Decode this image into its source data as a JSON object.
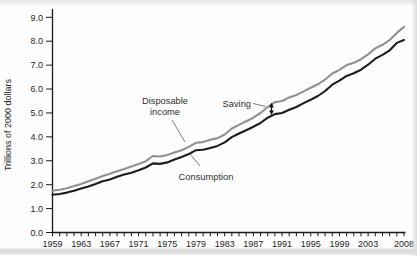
{
  "figure": {
    "labels": {
      "disposable_line1": "Disposable",
      "disposable_line2": "income",
      "saving": "Saving",
      "consumption": "Consumption"
    },
    "colors": {
      "disposable_income_line": "#8d9196",
      "consumption_line": "#1c1c1c",
      "axis": "#1a1a1a",
      "text": "#2e2e2e"
    }
  },
  "chart_data": {
    "type": "line",
    "title": "",
    "xlabel": "",
    "ylabel": "Trillions of 2000 dollars",
    "ylim": [
      0,
      9
    ],
    "ytick_labels": [
      "0.0",
      "1.0",
      "2.0",
      "3.0",
      "4.0",
      "5.0",
      "6.0",
      "7.0",
      "8.0",
      "9.0"
    ],
    "xtick_labels": [
      "1959",
      "1963",
      "1967",
      "1971",
      "1975",
      "1979",
      "1983",
      "1987",
      "1991",
      "1995",
      "1999",
      "2003",
      "2008"
    ],
    "grid": false,
    "legend": "inline annotations with pointer lines",
    "years": [
      1959,
      1960,
      1961,
      1962,
      1963,
      1964,
      1965,
      1966,
      1967,
      1968,
      1969,
      1970,
      1971,
      1972,
      1973,
      1974,
      1975,
      1976,
      1977,
      1978,
      1979,
      1980,
      1981,
      1982,
      1983,
      1984,
      1985,
      1986,
      1987,
      1988,
      1989,
      1990,
      1991,
      1992,
      1993,
      1994,
      1995,
      1996,
      1997,
      1998,
      1999,
      2000,
      2001,
      2002,
      2003,
      2004,
      2005,
      2006,
      2007,
      2008
    ],
    "series": [
      {
        "name": "Disposable income",
        "color": "#8d9196",
        "values": [
          1.75,
          1.79,
          1.85,
          1.94,
          2.03,
          2.14,
          2.25,
          2.36,
          2.46,
          2.56,
          2.65,
          2.76,
          2.87,
          2.98,
          3.2,
          3.18,
          3.24,
          3.34,
          3.44,
          3.58,
          3.75,
          3.78,
          3.88,
          3.95,
          4.1,
          4.35,
          4.5,
          4.65,
          4.8,
          5.0,
          5.25,
          5.45,
          5.5,
          5.65,
          5.75,
          5.9,
          6.05,
          6.2,
          6.4,
          6.65,
          6.8,
          7.0,
          7.1,
          7.25,
          7.45,
          7.7,
          7.85,
          8.05,
          8.35,
          8.6
        ]
      },
      {
        "name": "Consumption",
        "color": "#1c1c1c",
        "values": [
          1.58,
          1.61,
          1.67,
          1.75,
          1.84,
          1.93,
          2.03,
          2.14,
          2.22,
          2.33,
          2.42,
          2.5,
          2.6,
          2.72,
          2.89,
          2.87,
          2.93,
          3.05,
          3.16,
          3.28,
          3.44,
          3.46,
          3.54,
          3.62,
          3.77,
          3.99,
          4.14,
          4.28,
          4.42,
          4.58,
          4.8,
          4.95,
          5.0,
          5.13,
          5.25,
          5.41,
          5.55,
          5.71,
          5.92,
          6.18,
          6.35,
          6.55,
          6.66,
          6.81,
          7.02,
          7.27,
          7.43,
          7.62,
          7.93,
          8.05
        ]
      }
    ],
    "annotations": [
      {
        "text": "Disposable income",
        "points_to": "gray upper line"
      },
      {
        "text": "Saving",
        "points_to": "vertical double arrow between lines near 1990"
      },
      {
        "text": "Consumption",
        "points_to": "black lower line"
      }
    ]
  }
}
